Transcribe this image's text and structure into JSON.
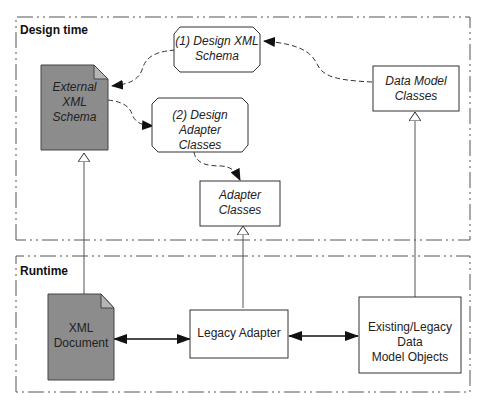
{
  "regions": {
    "design": {
      "title": "Design time"
    },
    "runtime": {
      "title": "Runtime"
    }
  },
  "nodes": {
    "external_schema": {
      "label": "External XML Schema",
      "line1": "External XML",
      "line2": "Schema",
      "shape": "document",
      "fill": "#8c8c8c"
    },
    "design_schema": {
      "label": "(1) Design XML Schema",
      "line1": "(1) Design XML",
      "line2": "Schema",
      "shape": "octagon"
    },
    "design_adapter": {
      "label": "(2) Design Adapter Classes",
      "line1": "(2) Design Adapter",
      "line2": "Classes",
      "shape": "octagon"
    },
    "adapter_classes": {
      "label": "Adapter Classes",
      "line1": "Adapter",
      "line2": "Classes",
      "shape": "rect"
    },
    "data_model_classes": {
      "label": "Data Model Classes",
      "line1": "Data Model",
      "line2": "Classes",
      "shape": "rect"
    },
    "xml_document": {
      "label": "XML Document",
      "line1": "XML",
      "line2": "Document",
      "shape": "document",
      "fill": "#8c8c8c"
    },
    "legacy_adapter": {
      "label": "Legacy Adapter",
      "shape": "rect"
    },
    "legacy_objects": {
      "label": "Existing/Legacy Data Model Objects",
      "line1": "Existing/Legacy Data",
      "line2": "Model Objects",
      "shape": "rect"
    }
  },
  "edges": [
    {
      "from": "design_schema",
      "to": "external_schema",
      "style": "dashed",
      "arrow": "filled"
    },
    {
      "from": "data_model_classes",
      "to": "design_schema",
      "style": "dashed",
      "arrow": "filled"
    },
    {
      "from": "external_schema",
      "to": "design_adapter",
      "style": "dashed",
      "arrow": "filled"
    },
    {
      "from": "design_adapter",
      "to": "adapter_classes",
      "style": "dashed",
      "arrow": "filled"
    },
    {
      "from": "xml_document",
      "to": "external_schema",
      "style": "solid",
      "arrow": "hollow-triangle"
    },
    {
      "from": "legacy_adapter",
      "to": "adapter_classes",
      "style": "solid",
      "arrow": "hollow-triangle"
    },
    {
      "from": "legacy_objects",
      "to": "data_model_classes",
      "style": "solid",
      "arrow": "hollow-triangle"
    },
    {
      "from": "xml_document",
      "to": "legacy_adapter",
      "style": "solid",
      "arrow": "bidirectional"
    },
    {
      "from": "legacy_adapter",
      "to": "legacy_objects",
      "style": "solid",
      "arrow": "bidirectional"
    }
  ]
}
